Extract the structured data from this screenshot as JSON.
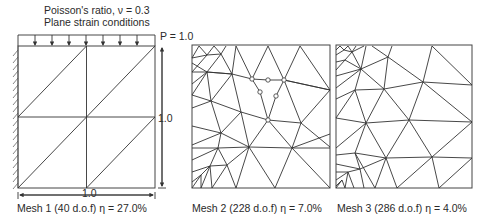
{
  "header": {
    "line1": "Poisson's ratio, ν = 0.3",
    "line2": "Plane strain conditions"
  },
  "load": {
    "label": "P = 1.0"
  },
  "dimensions": {
    "height": "1.0",
    "width": "1.0"
  },
  "meshes": [
    {
      "label": "Mesh 1 (40 d.o.f) η = 27.0%"
    },
    {
      "label": "Mesh 2 (228 d.o.f) η = 7.0%"
    },
    {
      "label": "Mesh 3 (286 d.o.f) η = 4.0%"
    }
  ],
  "colors": {
    "line": "#333333",
    "text": "#2a2a2a"
  }
}
